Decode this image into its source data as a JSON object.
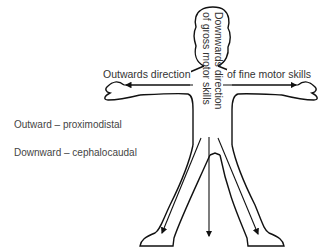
{
  "diagram": {
    "type": "human-figure-development-directions",
    "labels": {
      "outward_left": "Outwards direction",
      "outward_right": "of fine motor skills",
      "downward_line1": "Downwards direction",
      "downward_line2": "of gross motor skills"
    },
    "legend": [
      {
        "direction": "Outward",
        "separator": "–",
        "term": "proximodistal",
        "text": "Outward – proximodistal"
      },
      {
        "direction": "Downward",
        "separator": "–",
        "term": "cephalocaudal",
        "text": "Downward – cephalocaudal"
      }
    ],
    "arrows": [
      {
        "name": "left-arm-arrow",
        "direction": "left"
      },
      {
        "name": "right-arm-arrow",
        "direction": "right"
      },
      {
        "name": "center-down-arrow",
        "direction": "down"
      },
      {
        "name": "left-leg-arrow",
        "direction": "down-left"
      },
      {
        "name": "right-leg-arrow",
        "direction": "down-right"
      }
    ],
    "colors": {
      "outline": "#111111",
      "text": "#333333",
      "background": "#ffffff"
    }
  }
}
